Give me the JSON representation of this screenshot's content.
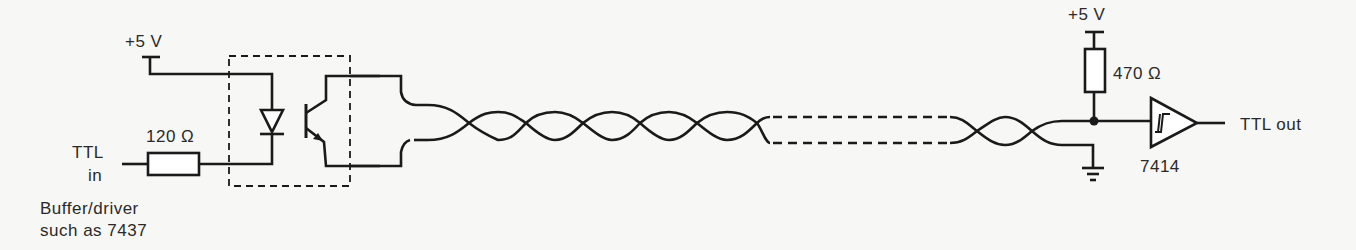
{
  "diagram": {
    "left": {
      "supply_label": "+5 V",
      "input_label_line1": "TTL",
      "input_label_line2": "in",
      "resistor_label": "120 Ω",
      "driver_note_line1": "Buffer/driver",
      "driver_note_line2": "such as 7437"
    },
    "isolator": {
      "type": "optocoupler",
      "components": [
        "LED",
        "phototransistor"
      ]
    },
    "cable": {
      "type": "twisted-pair",
      "segment": "dashed (continuation)"
    },
    "right": {
      "supply_label": "+5 V",
      "resistor_label": "470 Ω",
      "gate_label": "7414",
      "gate_type": "Schmitt-trigger buffer",
      "output_label": "TTL out",
      "ground": "ground-symbol"
    }
  }
}
